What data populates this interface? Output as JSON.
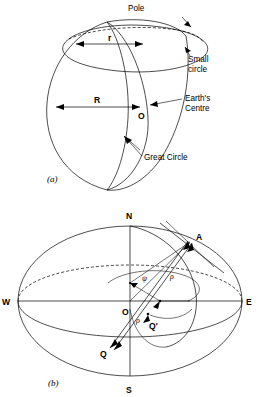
{
  "figure": {
    "background_color": "#ffffff",
    "line_color": "#000000"
  },
  "panel_a": {
    "caption": "(a)",
    "labels": {
      "pole": "Pole",
      "small_circle": "Small",
      "small_circle_2": "circle",
      "earths_centre": "Earth's",
      "earths_centre_2": "Centre",
      "great_circle": "Great Circle",
      "radius_small": "r",
      "radius_big": "R",
      "origin": "O"
    }
  },
  "panel_b": {
    "caption": "(b)",
    "labels": {
      "north": "N",
      "south": "S",
      "west": "W",
      "east": "E",
      "origin": "O",
      "point_a": "A",
      "point_q": "Q",
      "point_q_prime": "Q'",
      "angle_psi": "ψ",
      "length_p": "ρ",
      "angle_rho": "ρ"
    }
  }
}
